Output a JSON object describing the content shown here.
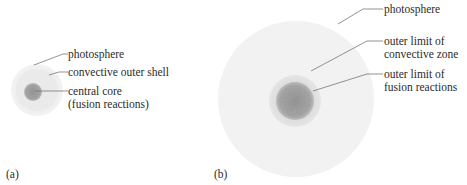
{
  "panels": [
    {
      "id": "a",
      "tag": "(a)",
      "labels": {
        "photosphere": "photosphere",
        "convective": "convective outer shell",
        "core_line1": "central core",
        "core_line2": "(fusion reactions)"
      }
    },
    {
      "id": "b",
      "tag": "(b)",
      "labels": {
        "photosphere": "photosphere",
        "convective_line1": "outer limit of",
        "convective_line2": "convective zone",
        "fusion_line1": "outer limit of",
        "fusion_line2": "fusion reactions"
      }
    }
  ],
  "colors": {
    "photosphere": "#f1f1f1",
    "convective": "#e0e0e0",
    "core": "#9a9a9a",
    "leader": "#6e6e6e"
  }
}
